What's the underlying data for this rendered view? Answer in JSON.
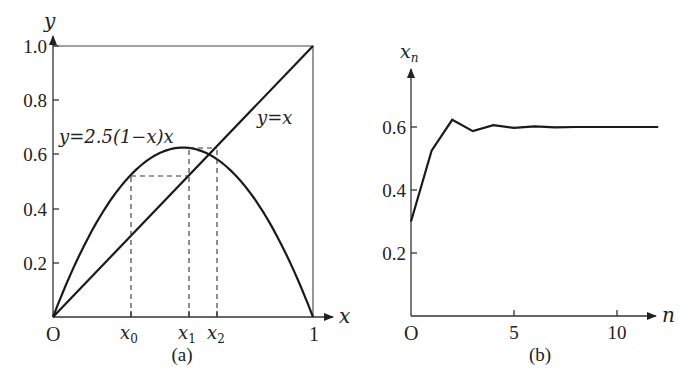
{
  "figure_a": {
    "caption": "(a)",
    "y_axis_label": "y",
    "x_axis_label": "x",
    "origin_label": "O",
    "x_end_label": "1",
    "y_ticks": [
      "0.2",
      "0.4",
      "0.6",
      "0.8",
      "1.0"
    ],
    "curve_label": "y=2.5(1−x)x",
    "line_label": "y=x",
    "x_marks": [
      {
        "base": "x",
        "sub": "0",
        "value": 0.3
      },
      {
        "base": "x",
        "sub": "1",
        "value": 0.525
      },
      {
        "base": "x",
        "sub": "2",
        "value": 0.6234
      }
    ],
    "r": 2.5
  },
  "figure_b": {
    "caption": "(b)",
    "y_axis_label_base": "x",
    "y_axis_label_sub": "n",
    "x_axis_label": "n",
    "origin_label": "O",
    "x_ticks": [
      "5",
      "10"
    ],
    "y_ticks": [
      "0.2",
      "0.4",
      "0.6"
    ]
  },
  "chart_data": [
    {
      "type": "line",
      "title": "(a) Cobweb diagram of logistic map",
      "xlabel": "x",
      "ylabel": "y",
      "xlim": [
        0,
        1
      ],
      "ylim": [
        0,
        1
      ],
      "series": [
        {
          "name": "y=2.5(1−x)x",
          "function": "2.5*(1-x)*x"
        },
        {
          "name": "y=x",
          "function": "x"
        }
      ],
      "annotations": [
        {
          "label": "x0",
          "x": 0.3
        },
        {
          "label": "x1",
          "x": 0.525
        },
        {
          "label": "x2",
          "x": 0.6234
        }
      ]
    },
    {
      "type": "line",
      "title": "(b) Iterates x_n",
      "xlabel": "n",
      "ylabel": "x_n",
      "x": [
        0,
        1,
        2,
        3,
        4,
        5,
        6,
        7,
        8,
        9,
        10,
        11,
        12
      ],
      "series": [
        {
          "name": "x_n",
          "values": [
            0.3,
            0.525,
            0.623,
            0.587,
            0.606,
            0.597,
            0.602,
            0.599,
            0.6,
            0.6,
            0.6,
            0.6,
            0.6
          ]
        }
      ],
      "x_ticks": [
        0,
        5,
        10
      ],
      "y_ticks": [
        0.2,
        0.4,
        0.6
      ],
      "ylim": [
        0,
        0.75
      ]
    }
  ]
}
